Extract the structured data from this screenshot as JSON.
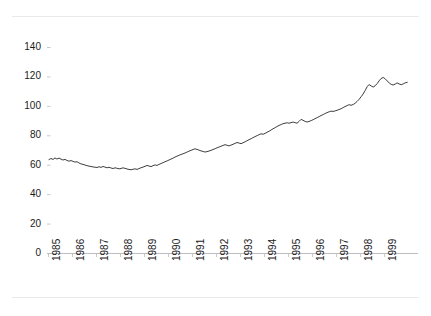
{
  "chart_data": {
    "type": "line",
    "title": "",
    "subtitle": "",
    "xlabel": "",
    "ylabel": "",
    "xlim": [
      1985.0,
      1999.95
    ],
    "ylim": [
      0,
      150
    ],
    "ytick_labels": [
      "140",
      "120",
      "100",
      "80",
      "60",
      "40",
      "20",
      "0"
    ],
    "ytick_values": [
      140,
      120,
      100,
      80,
      60,
      40,
      20,
      0
    ],
    "xtick_labels": [
      "1985",
      "1986",
      "1987",
      "1988",
      "1989",
      "1990",
      "1991",
      "1992",
      "1993",
      "1994",
      "1995",
      "1996",
      "1997",
      "1998",
      "1999"
    ],
    "xtick_values": [
      1985,
      1986,
      1987,
      1988,
      1989,
      1990,
      1991,
      1992,
      1993,
      1994,
      1995,
      1996,
      1997,
      1998,
      1999
    ],
    "grid": false,
    "legend": null,
    "legend_position": "none",
    "series": [
      {
        "name": "index",
        "color": "#3c3c3c",
        "x": [
          1985.04,
          1985.12,
          1985.21,
          1985.29,
          1985.37,
          1985.46,
          1985.54,
          1985.62,
          1985.71,
          1985.79,
          1985.87,
          1985.96,
          1986.04,
          1986.12,
          1986.21,
          1986.29,
          1986.37,
          1986.46,
          1986.54,
          1986.62,
          1986.71,
          1986.79,
          1986.87,
          1986.96,
          1987.04,
          1987.12,
          1987.21,
          1987.29,
          1987.37,
          1987.46,
          1987.54,
          1987.62,
          1987.71,
          1987.79,
          1987.87,
          1987.96,
          1988.04,
          1988.12,
          1988.21,
          1988.29,
          1988.37,
          1988.46,
          1988.54,
          1988.62,
          1988.71,
          1988.79,
          1988.87,
          1988.96,
          1989.04,
          1989.12,
          1989.21,
          1989.29,
          1989.37,
          1989.46,
          1989.54,
          1989.62,
          1989.71,
          1989.79,
          1989.87,
          1989.96,
          1990.04,
          1990.12,
          1990.21,
          1990.29,
          1990.37,
          1990.46,
          1990.54,
          1990.62,
          1990.71,
          1990.79,
          1990.87,
          1990.96,
          1991.04,
          1991.12,
          1991.21,
          1991.29,
          1991.37,
          1991.46,
          1991.54,
          1991.62,
          1991.71,
          1991.79,
          1991.87,
          1991.96,
          1992.04,
          1992.12,
          1992.21,
          1992.29,
          1992.37,
          1992.46,
          1992.54,
          1992.62,
          1992.71,
          1992.79,
          1992.87,
          1992.96,
          1993.04,
          1993.12,
          1993.21,
          1993.29,
          1993.37,
          1993.46,
          1993.54,
          1993.62,
          1993.71,
          1993.79,
          1993.87,
          1993.96,
          1994.04,
          1994.12,
          1994.21,
          1994.29,
          1994.37,
          1994.46,
          1994.54,
          1994.62,
          1994.71,
          1994.79,
          1994.87,
          1994.96,
          1995.04,
          1995.12,
          1995.21,
          1995.29,
          1995.37,
          1995.46,
          1995.54,
          1995.62,
          1995.71,
          1995.79,
          1995.87,
          1995.96,
          1996.04,
          1996.12,
          1996.21,
          1996.29,
          1996.37,
          1996.46,
          1996.54,
          1996.62,
          1996.71,
          1996.79,
          1996.87,
          1996.96,
          1997.04,
          1997.12,
          1997.21,
          1997.29,
          1997.37,
          1997.46,
          1997.54,
          1997.62,
          1997.71,
          1997.79,
          1997.87,
          1997.96,
          1998.04,
          1998.12,
          1998.21,
          1998.29,
          1998.37,
          1998.46,
          1998.54,
          1998.62,
          1998.71,
          1998.79,
          1998.87,
          1998.96,
          1999.04,
          1999.12,
          1999.21,
          1999.29,
          1999.37,
          1999.46,
          1999.54,
          1999.62,
          1999.71,
          1999.79,
          1999.87,
          1999.96
        ],
        "values": [
          63.5,
          64.2,
          63.6,
          64.6,
          63.9,
          64.5,
          63.8,
          63.2,
          63.6,
          62.9,
          62.4,
          62.8,
          62.3,
          61.8,
          62.0,
          61.2,
          60.6,
          60.2,
          59.8,
          59.4,
          59.0,
          58.8,
          58.5,
          58.3,
          58.1,
          58.6,
          58.2,
          58.8,
          58.4,
          57.9,
          58.3,
          57.8,
          57.4,
          57.9,
          57.6,
          57.2,
          57.4,
          57.9,
          57.5,
          57.1,
          56.8,
          56.6,
          56.9,
          57.2,
          56.8,
          57.4,
          57.9,
          58.4,
          58.9,
          59.5,
          59.1,
          58.7,
          59.3,
          59.9,
          59.5,
          60.2,
          60.8,
          61.4,
          62.0,
          62.6,
          63.2,
          63.8,
          64.5,
          65.2,
          65.8,
          66.4,
          67.0,
          67.4,
          68.0,
          68.6,
          69.2,
          69.8,
          70.3,
          70.8,
          70.4,
          69.9,
          69.4,
          69.0,
          68.6,
          68.9,
          69.3,
          69.8,
          70.3,
          70.9,
          71.5,
          72.0,
          72.6,
          73.1,
          73.6,
          73.2,
          72.8,
          73.3,
          73.9,
          74.5,
          75.1,
          74.7,
          74.3,
          74.9,
          75.6,
          76.3,
          77.0,
          77.7,
          78.4,
          79.1,
          79.8,
          80.4,
          81.0,
          80.7,
          81.3,
          82.0,
          82.8,
          83.6,
          84.4,
          85.2,
          86.0,
          86.7,
          87.3,
          87.9,
          88.2,
          88.5,
          88.2,
          88.6,
          89.0,
          88.6,
          88.2,
          89.5,
          90.8,
          90.2,
          89.4,
          89.0,
          89.4,
          90.0,
          90.6,
          91.3,
          92.0,
          92.7,
          93.4,
          94.1,
          94.8,
          95.4,
          96.0,
          96.4,
          96.2,
          96.6,
          97.0,
          97.5,
          98.1,
          98.8,
          99.5,
          100.2,
          100.8,
          100.4,
          100.9,
          101.8,
          103.0,
          104.5,
          106.2,
          108.0,
          110.5,
          113.0,
          114.5,
          113.5,
          112.8,
          113.6,
          115.2,
          117.0,
          118.6,
          119.3,
          118.4,
          117.0,
          115.6,
          114.6,
          114.2,
          114.8,
          115.6,
          114.9,
          114.4,
          114.9,
          115.6,
          116.0
        ]
      }
    ]
  },
  "axes": {
    "y_axis_name": "value-axis",
    "x_axis_name": "year-axis"
  }
}
